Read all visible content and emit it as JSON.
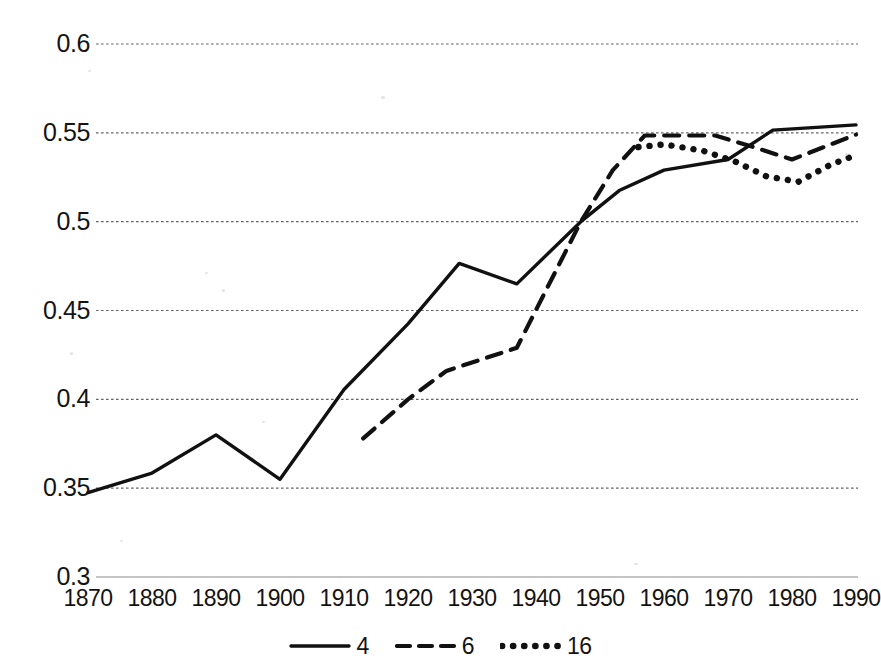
{
  "chart_data": {
    "type": "line",
    "title": "",
    "subtitle": "",
    "xlabel": "",
    "ylabel": "",
    "xlim": [
      1870,
      1990
    ],
    "ylim": [
      0.3,
      0.6
    ],
    "grid": true,
    "grid_style": "dotted-horizontal",
    "legend_position": "bottom-center",
    "x_ticks": [
      1870,
      1880,
      1890,
      1900,
      1910,
      1920,
      1930,
      1940,
      1950,
      1960,
      1970,
      1980,
      1990
    ],
    "x_tick_labels": [
      "1870",
      "1880",
      "1890",
      "1900",
      "1910",
      "1920",
      "1930",
      "1940",
      "1950",
      "1960",
      "1970",
      "1980",
      "1990"
    ],
    "y_ticks": [
      0.3,
      0.35,
      0.4,
      0.45,
      0.5,
      0.55,
      0.6
    ],
    "y_tick_labels": [
      "0.3",
      "0.35",
      "0.4",
      "0.45",
      "0.5",
      "0.55",
      "0.6"
    ],
    "series": [
      {
        "name": "4",
        "style": "solid",
        "color": "#111111",
        "points": [
          [
            1870,
            0.3475
          ],
          [
            1880,
            0.3585
          ],
          [
            1890,
            0.38
          ],
          [
            1900,
            0.355
          ],
          [
            1910,
            0.4055
          ],
          [
            1920,
            0.4425
          ],
          [
            1928,
            0.4765
          ],
          [
            1937,
            0.465
          ],
          [
            1947,
            0.5
          ],
          [
            1953,
            0.5175
          ],
          [
            1960,
            0.529
          ],
          [
            1970,
            0.535
          ],
          [
            1977,
            0.5515
          ],
          [
            1990,
            0.5545
          ]
        ]
      },
      {
        "name": "6",
        "style": "dashed",
        "color": "#111111",
        "points": [
          [
            1913,
            0.378
          ],
          [
            1920,
            0.4
          ],
          [
            1926,
            0.416
          ],
          [
            1937,
            0.429
          ],
          [
            1947,
            0.5
          ],
          [
            1952,
            0.529
          ],
          [
            1957,
            0.5485
          ],
          [
            1968,
            0.5485
          ],
          [
            1974,
            0.542
          ],
          [
            1980,
            0.535
          ],
          [
            1990,
            0.549
          ]
        ]
      },
      {
        "name": "16",
        "style": "dotted",
        "color": "#111111",
        "points": [
          [
            1956,
            0.542
          ],
          [
            1960,
            0.5435
          ],
          [
            1966,
            0.54
          ],
          [
            1971,
            0.534
          ],
          [
            1976,
            0.5255
          ],
          [
            1981,
            0.5225
          ],
          [
            1986,
            0.532
          ],
          [
            1990,
            0.5375
          ]
        ]
      }
    ],
    "legend": [
      {
        "label": "4",
        "style": "solid"
      },
      {
        "label": "6",
        "style": "dashed"
      },
      {
        "label": "16",
        "style": "dotted"
      }
    ]
  }
}
